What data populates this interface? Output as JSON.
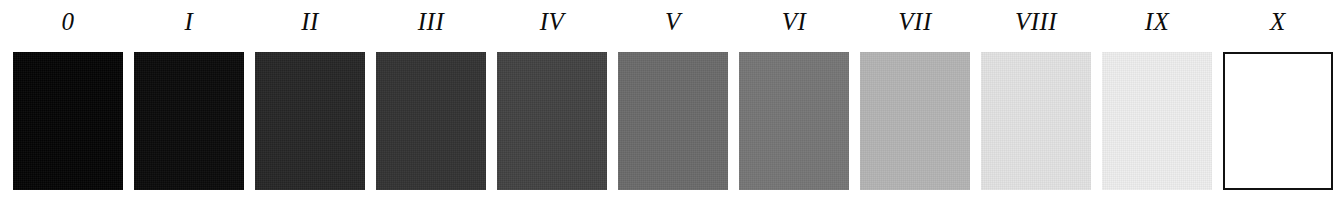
{
  "figure": {
    "type": "gray-scale-step-wedge",
    "title": "",
    "background_color": "#ffffff",
    "label_color": "#0c0c0c",
    "outline_color": "#111111"
  },
  "chart_data": {
    "type": "bar",
    "title": "",
    "subtitle": "",
    "xlabel": "",
    "ylabel": "",
    "grid": false,
    "legend": "none",
    "categories": [
      "0",
      "I",
      "II",
      "III",
      "IV",
      "V",
      "VI",
      "VII",
      "VIII",
      "IX",
      "X"
    ],
    "values": [
      4,
      10,
      38,
      51,
      66,
      107,
      118,
      181,
      227,
      238,
      255
    ],
    "value_unit": "gray level (0-255)",
    "colors": [
      "#040404",
      "#0a0a0a",
      "#262626",
      "#333333",
      "#424242",
      "#6b6b6b",
      "#767676",
      "#b5b5b5",
      "#e3e3e3",
      "#eeeeee",
      "#ffffff"
    ],
    "ylim": [
      0,
      255
    ]
  },
  "steps": [
    {
      "label": "0",
      "color": "#040404",
      "gray_level": 4,
      "outlined": false
    },
    {
      "label": "I",
      "color": "#0a0a0a",
      "gray_level": 10,
      "outlined": false
    },
    {
      "label": "II",
      "color": "#262626",
      "gray_level": 38,
      "outlined": false
    },
    {
      "label": "III",
      "color": "#333333",
      "gray_level": 51,
      "outlined": false
    },
    {
      "label": "IV",
      "color": "#424242",
      "gray_level": 66,
      "outlined": false
    },
    {
      "label": "V",
      "color": "#6b6b6b",
      "gray_level": 107,
      "outlined": false
    },
    {
      "label": "VI",
      "color": "#767676",
      "gray_level": 118,
      "outlined": false
    },
    {
      "label": "VII",
      "color": "#b5b5b5",
      "gray_level": 181,
      "outlined": false
    },
    {
      "label": "VIII",
      "color": "#e3e3e3",
      "gray_level": 227,
      "outlined": false
    },
    {
      "label": "IX",
      "color": "#eeeeee",
      "gray_level": 238,
      "outlined": false
    },
    {
      "label": "X",
      "color": "#ffffff",
      "gray_level": 255,
      "outlined": true
    }
  ]
}
